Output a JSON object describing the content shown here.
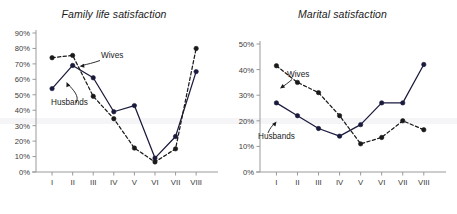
{
  "chart_data": [
    {
      "type": "line",
      "title": "Family life satisfaction",
      "xlabel": "",
      "ylabel": "",
      "categories": [
        "I",
        "II",
        "III",
        "IV",
        "V",
        "VI",
        "VII",
        "VIII"
      ],
      "ytick_labels": [
        "0%",
        "10%",
        "20%",
        "30%",
        "40%",
        "50%",
        "60%",
        "70%",
        "80%",
        "90%"
      ],
      "ylim": [
        0,
        90
      ],
      "ytick_step": 10,
      "grid": false,
      "legend_position": "inline-annotation",
      "annotations": [
        {
          "text": "Wives",
          "target_series": "Wives"
        },
        {
          "text": "Husbands",
          "target_series": "Husbands"
        }
      ],
      "series": [
        {
          "name": "Husbands",
          "style": "solid",
          "marker": "filled-circle",
          "color": "#1a1a3c",
          "values": [
            54,
            69,
            61,
            39,
            43,
            9,
            23,
            65
          ]
        },
        {
          "name": "Wives",
          "style": "dashed",
          "marker": "filled-circle",
          "color": "#1a1a1a",
          "values": [
            74,
            75.5,
            49,
            34.5,
            15.5,
            6.5,
            15,
            80
          ]
        }
      ]
    },
    {
      "type": "line",
      "title": "Marital satisfaction",
      "xlabel": "",
      "ylabel": "",
      "categories": [
        "I",
        "II",
        "III",
        "IV",
        "V",
        "VI",
        "VII",
        "VIII"
      ],
      "ytick_labels": [
        "0%",
        "10%",
        "20%",
        "30%",
        "40%",
        "50%"
      ],
      "ylim": [
        0,
        50
      ],
      "ytick_step": 10,
      "grid": false,
      "legend_position": "inline-annotation",
      "annotations": [
        {
          "text": "Wives",
          "target_series": "Wives"
        },
        {
          "text": "Husbands",
          "target_series": "Husbands"
        }
      ],
      "series": [
        {
          "name": "Husbands",
          "style": "solid",
          "marker": "filled-circle",
          "color": "#1a1a3c",
          "values": [
            27,
            22,
            17,
            14,
            18.5,
            27,
            27,
            42
          ]
        },
        {
          "name": "Wives",
          "style": "dashed",
          "marker": "filled-circle",
          "color": "#1a1a1a",
          "values": [
            41.5,
            35,
            31,
            22,
            11,
            13.5,
            20,
            16.5,
            38
          ]
        }
      ]
    }
  ],
  "left_chart": {
    "title": "Family life satisfaction",
    "wives_label": "Wives",
    "husbands_label": "Husbands"
  },
  "right_chart": {
    "title": "Marital satisfaction",
    "wives_label": "Wives",
    "husbands_label": "Husbands"
  },
  "colors": {
    "axis": "#9a9a9a",
    "husbands_line": "#1a1a3c",
    "wives_line": "#1a1a1a",
    "text": "#2b2b2b",
    "background": "#ffffff"
  }
}
